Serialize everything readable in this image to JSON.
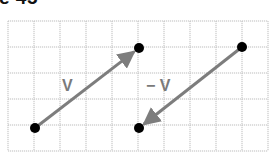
{
  "caption": "e 45",
  "grid": {
    "x0": 8,
    "y0": 21,
    "cols": 10,
    "rows": 5,
    "cell": 26,
    "line_color": "#bdbdbd"
  },
  "vectors": [
    {
      "label": "V",
      "from": [
        35,
        128
      ],
      "to": [
        139,
        48
      ],
      "label_pos": [
        62,
        91
      ]
    },
    {
      "label": "− V",
      "from": [
        242,
        47
      ],
      "to": [
        139,
        128
      ],
      "label_pos": [
        146,
        91
      ]
    }
  ],
  "points": [
    [
      35,
      128
    ],
    [
      139,
      48
    ],
    [
      242,
      47
    ],
    [
      139,
      128
    ]
  ],
  "colors": {
    "vector": "#7d7d7d",
    "point": "#000000"
  }
}
